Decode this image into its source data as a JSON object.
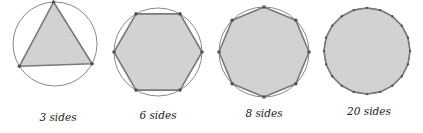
{
  "figure": {
    "colors": {
      "circle_stroke": "#8a8a8a",
      "polygon_fill": "#d2d2d2",
      "polygon_stroke": "#7a7a7a",
      "vertex_dot": "#555555",
      "background": "#ffffff"
    },
    "panels": [
      {
        "sides": 3,
        "label": "3 sides",
        "cx": 55,
        "cy": 44,
        "r": 42,
        "rotation_deg": -92,
        "label_x": 58,
        "label_y": 111
      },
      {
        "sides": 6,
        "label": "6 sides",
        "cx": 158,
        "cy": 52,
        "r": 44,
        "rotation_deg": 0,
        "label_x": 158,
        "label_y": 109
      },
      {
        "sides": 8,
        "label": "8 sides",
        "cx": 264,
        "cy": 52,
        "r": 45,
        "rotation_deg": 0,
        "label_x": 264,
        "label_y": 107
      },
      {
        "sides": 20,
        "label": "20 sides",
        "cx": 367,
        "cy": 51,
        "r": 43,
        "rotation_deg": 0,
        "label_x": 369,
        "label_y": 105
      }
    ]
  }
}
